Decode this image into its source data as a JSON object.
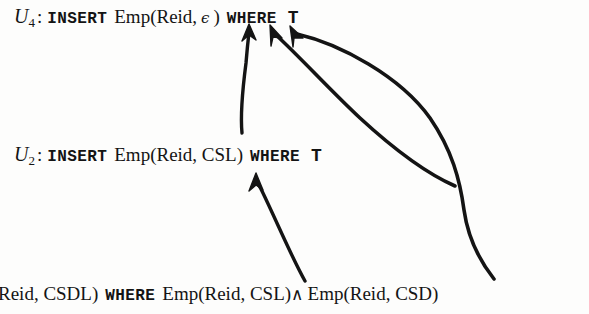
{
  "figure": {
    "kind": "update-dependency-diagram",
    "background_color": "#fdfdfc",
    "ink_color": "#141414",
    "width": 589,
    "height": 314
  },
  "statements": [
    {
      "id": "u4",
      "label_base": "U",
      "label_sub": "4",
      "colon": ":",
      "keyword_insert": "INSERT",
      "relation": "Emp(Reid,",
      "arg_epsilon": "ϵ",
      "close_paren": ")",
      "keyword_where": "WHERE",
      "condition": "T"
    },
    {
      "id": "u2",
      "label_base": "U",
      "label_sub": "2",
      "colon": ":",
      "keyword_insert": "INSERT",
      "relation": "Emp(Reid, CSL)",
      "keyword_where": "WHERE",
      "condition": "T"
    },
    {
      "id": "u1",
      "label_base": "",
      "label_sub": "",
      "colon": "",
      "keyword_insert": "",
      "relation": "Reid, CSDL)",
      "keyword_where": "WHERE",
      "cond_left": "Emp(Reid, CSL)",
      "cond_connective": "∧",
      "cond_right": "Emp(Reid, CSD)"
    }
  ],
  "arrows": [
    {
      "name": "arrow-u2-to-u4",
      "from": "U2 statement line",
      "to": "U4 statement line",
      "head_x": 249,
      "head_y": 26,
      "tail_x": 242,
      "tail_y": 132
    },
    {
      "name": "arrow-cond-csl-to-u4",
      "from": "Emp(Reid, CSL) condition",
      "to": "U4 statement line",
      "head_x": 272,
      "head_y": 27,
      "tail_x": 451,
      "tail_y": 188
    },
    {
      "name": "arrow-cond-csd-to-u4",
      "from": "Emp(Reid, CSD) condition",
      "to": "U4 statement line",
      "head_x": 293,
      "head_y": 28,
      "tail_x": 495,
      "tail_y": 280
    },
    {
      "name": "arrow-cond-csl-to-u2",
      "from": "Emp(Reid, CSL) condition",
      "to": "U2 statement line",
      "head_x": 256,
      "head_y": 178,
      "tail_x": 305,
      "tail_y": 282
    }
  ]
}
